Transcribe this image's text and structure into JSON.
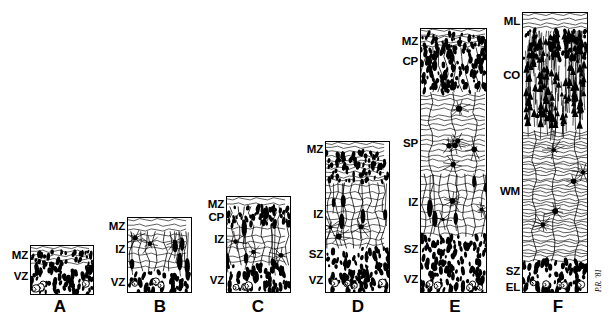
{
  "figure": {
    "type": "schematic-diagram",
    "background_color": "#ffffff",
    "ink_color": "#000000",
    "width": 609,
    "height": 319,
    "signature": "P.R. '81"
  },
  "panels": [
    {
      "id": "A",
      "letter": "A",
      "letter_x": 60,
      "letter_y": 306,
      "column": {
        "x": 30,
        "y": 245,
        "w": 64,
        "h": 50
      },
      "zones": [
        {
          "code": "MZ",
          "name": "marginal zone",
          "label_x": 28,
          "label_y": 256,
          "band_top": 0.0,
          "band_bottom": 0.42
        },
        {
          "code": "VZ",
          "name": "ventricular zone",
          "label_x": 28,
          "label_y": 277,
          "band_top": 0.42,
          "band_bottom": 1.0
        }
      ]
    },
    {
      "id": "B",
      "letter": "B",
      "letter_x": 160,
      "letter_y": 306,
      "column": {
        "x": 127,
        "y": 217,
        "w": 65,
        "h": 76
      },
      "zones": [
        {
          "code": "MZ",
          "name": "marginal zone",
          "label_x": 125,
          "label_y": 227,
          "band_top": 0.0,
          "band_bottom": 0.18
        },
        {
          "code": "IZ",
          "name": "intermediate zone",
          "label_x": 125,
          "label_y": 250,
          "band_top": 0.18,
          "band_bottom": 0.72
        },
        {
          "code": "VZ",
          "name": "ventricular zone",
          "label_x": 125,
          "label_y": 283,
          "band_top": 0.72,
          "band_bottom": 1.0
        }
      ]
    },
    {
      "id": "C",
      "letter": "C",
      "letter_x": 258,
      "letter_y": 306,
      "column": {
        "x": 226,
        "y": 196,
        "w": 65,
        "h": 97
      },
      "zones": [
        {
          "code": "MZ",
          "name": "marginal zone",
          "label_x": 224,
          "label_y": 205,
          "band_top": 0.0,
          "band_bottom": 0.1
        },
        {
          "code": "CP",
          "name": "cortical plate",
          "label_x": 224,
          "label_y": 218,
          "band_top": 0.1,
          "band_bottom": 0.3
        },
        {
          "code": "IZ",
          "name": "intermediate zone",
          "label_x": 224,
          "label_y": 240,
          "band_top": 0.3,
          "band_bottom": 0.72
        },
        {
          "code": "VZ",
          "name": "ventricular zone",
          "label_x": 224,
          "label_y": 281,
          "band_top": 0.72,
          "band_bottom": 1.0
        }
      ]
    },
    {
      "id": "D",
      "letter": "D",
      "letter_x": 358,
      "letter_y": 306,
      "column": {
        "x": 325,
        "y": 141,
        "w": 65,
        "h": 152
      },
      "zones": [
        {
          "code": "MZ",
          "name": "marginal zone",
          "label_x": 323,
          "label_y": 150,
          "band_top": 0.0,
          "band_bottom": 0.27
        },
        {
          "code": "IZ",
          "name": "intermediate zone",
          "label_x": 323,
          "label_y": 215,
          "band_top": 0.27,
          "band_bottom": 0.71
        },
        {
          "code": "SZ",
          "name": "subventricular zone",
          "label_x": 323,
          "label_y": 255,
          "band_top": 0.71,
          "band_bottom": 0.89
        },
        {
          "code": "VZ",
          "name": "ventricular zone",
          "label_x": 323,
          "label_y": 281,
          "band_top": 0.89,
          "band_bottom": 1.0
        }
      ]
    },
    {
      "id": "E",
      "letter": "E",
      "letter_x": 455,
      "letter_y": 306,
      "column": {
        "x": 420,
        "y": 28,
        "w": 67,
        "h": 265
      },
      "zones": [
        {
          "code": "MZ",
          "name": "marginal zone",
          "label_x": 418,
          "label_y": 42,
          "band_top": 0.0,
          "band_bottom": 0.07
        },
        {
          "code": "CP",
          "name": "cortical plate",
          "label_x": 418,
          "label_y": 62,
          "band_top": 0.07,
          "band_bottom": 0.24
        },
        {
          "code": "SP",
          "name": "subplate",
          "label_x": 418,
          "label_y": 144,
          "band_top": 0.24,
          "band_bottom": 0.55
        },
        {
          "code": "IZ",
          "name": "intermediate zone",
          "label_x": 418,
          "label_y": 203,
          "band_top": 0.55,
          "band_bottom": 0.79
        },
        {
          "code": "SZ",
          "name": "subventricular zone",
          "label_x": 418,
          "label_y": 250,
          "band_top": 0.79,
          "band_bottom": 0.92
        },
        {
          "code": "VZ",
          "name": "ventricular zone",
          "label_x": 418,
          "label_y": 280,
          "band_top": 0.92,
          "band_bottom": 1.0
        }
      ]
    },
    {
      "id": "F",
      "letter": "F",
      "letter_x": 558,
      "letter_y": 306,
      "column": {
        "x": 522,
        "y": 12,
        "w": 66,
        "h": 281
      },
      "zones": [
        {
          "code": "ML",
          "name": "molecular layer",
          "label_x": 520,
          "label_y": 22,
          "band_top": 0.0,
          "band_bottom": 0.06
        },
        {
          "code": "CO",
          "name": "cortex",
          "label_x": 520,
          "label_y": 76,
          "band_top": 0.06,
          "band_bottom": 0.42
        },
        {
          "code": "WM",
          "name": "white matter",
          "label_x": 520,
          "label_y": 192,
          "band_top": 0.42,
          "band_bottom": 0.89
        },
        {
          "code": "SZ",
          "name": "subventricular zone",
          "label_x": 520,
          "label_y": 272,
          "band_top": 0.89,
          "band_bottom": 0.96
        },
        {
          "code": "EL",
          "name": "ependymal layer",
          "label_x": 520,
          "label_y": 288,
          "band_top": 0.96,
          "band_bottom": 1.0
        }
      ]
    }
  ]
}
